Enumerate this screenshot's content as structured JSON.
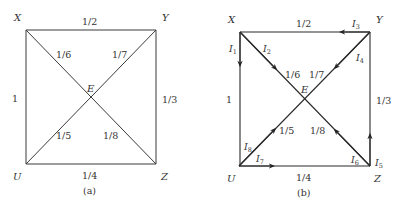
{
  "figure_a": {
    "caption": "(a)",
    "nodes": {
      "X": {
        "label": "X"
      },
      "Y": {
        "label": "Y"
      },
      "U": {
        "label": "U"
      },
      "Z": {
        "label": "Z"
      },
      "E": {
        "label": "E"
      }
    },
    "edges": {
      "XY": "1/2",
      "XU": "1",
      "YZ": "1/3",
      "UZ": "1/4",
      "XE": "1/6",
      "YE": "1/7",
      "UE": "1/5",
      "ZE": "1/8"
    }
  },
  "figure_b": {
    "caption": "(b)",
    "nodes": {
      "X": {
        "label": "X"
      },
      "Y": {
        "label": "Y"
      },
      "U": {
        "label": "U"
      },
      "Z": {
        "label": "Z"
      },
      "E": {
        "label": "E"
      }
    },
    "edges": {
      "XY": "1/2",
      "XU": "1",
      "YZ": "1/3",
      "UZ": "1/4",
      "XE": "1/6",
      "YE": "1/7",
      "UE": "1/5",
      "ZE": "1/8"
    },
    "currents": [
      {
        "id": "I1",
        "base": "I",
        "sub": "1",
        "edge": "X→U"
      },
      {
        "id": "I2",
        "base": "I",
        "sub": "2",
        "edge": "X→E"
      },
      {
        "id": "I3",
        "base": "I",
        "sub": "3",
        "edge": "Y→X"
      },
      {
        "id": "I4",
        "base": "I",
        "sub": "4",
        "edge": "Y→E"
      },
      {
        "id": "I5",
        "base": "I",
        "sub": "5",
        "edge": "Z→Y"
      },
      {
        "id": "I6",
        "base": "I",
        "sub": "6",
        "edge": "Z→E"
      },
      {
        "id": "I7",
        "base": "I",
        "sub": "7",
        "edge": "U→Z"
      },
      {
        "id": "I8",
        "base": "I",
        "sub": "8",
        "edge": "U→E"
      }
    ]
  }
}
